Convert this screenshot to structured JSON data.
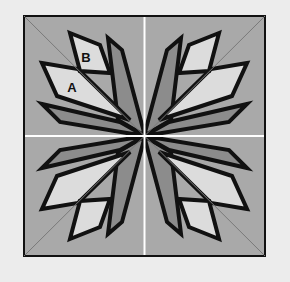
{
  "diagram": {
    "labels": {
      "piece_a": "A",
      "piece_b": "B"
    },
    "colors": {
      "page_background": "#ececec",
      "block_background": "#a9a9a9",
      "light_piece": "#dcdcdc",
      "dark_piece": "#8c8c8c",
      "outline": "#111111",
      "guide_line_white": "#ffffff",
      "diagonal_line": "#7a7a7a"
    }
  }
}
